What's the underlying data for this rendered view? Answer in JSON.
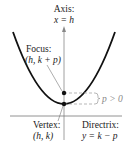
{
  "diagram": {
    "axis_label": {
      "line1": "Axis:",
      "line2": "x = h"
    },
    "focus_label": {
      "line1": "Focus:",
      "line2": "(h, k + p)"
    },
    "vertex_label": {
      "line1": "Vertex:",
      "line2": "(h, k)"
    },
    "directrix_label": {
      "line1": "Directrix:",
      "line2": "y = k − p"
    },
    "p_label": "p > 0",
    "colors": {
      "curve": "#111111",
      "axis": "#888888",
      "directrix": "#777777",
      "dashed": "#999999",
      "text": "#222222"
    }
  }
}
